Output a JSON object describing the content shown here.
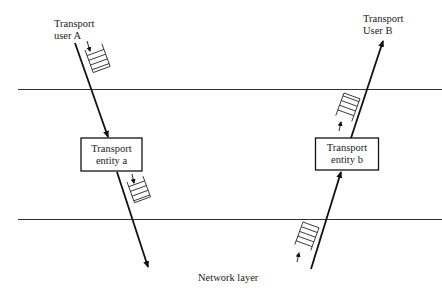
{
  "diagram": {
    "labels": {
      "user_a": [
        "Transport",
        "user A"
      ],
      "user_b": [
        "Transport",
        "User B"
      ],
      "entity_a": [
        "Transport",
        "entity a"
      ],
      "entity_b": [
        "Transport",
        "entity b"
      ],
      "network_layer": "Network layer"
    },
    "boundaries": [
      "upper layer boundary",
      "network layer boundary"
    ],
    "flows": [
      {
        "from": "Transport user A",
        "to": "Transport entity a",
        "direction": "down"
      },
      {
        "from": "Transport entity a",
        "to": "Network layer",
        "direction": "down"
      },
      {
        "from": "Network layer",
        "to": "Transport entity b",
        "direction": "up"
      },
      {
        "from": "Transport entity b",
        "to": "Transport User B",
        "direction": "up"
      }
    ],
    "queues": [
      {
        "location": "between user A and entity a",
        "flow": "down"
      },
      {
        "location": "between entity a and network",
        "flow": "down"
      },
      {
        "location": "between entity b and user B",
        "flow": "up"
      },
      {
        "location": "between network and entity b",
        "flow": "up"
      }
    ]
  }
}
